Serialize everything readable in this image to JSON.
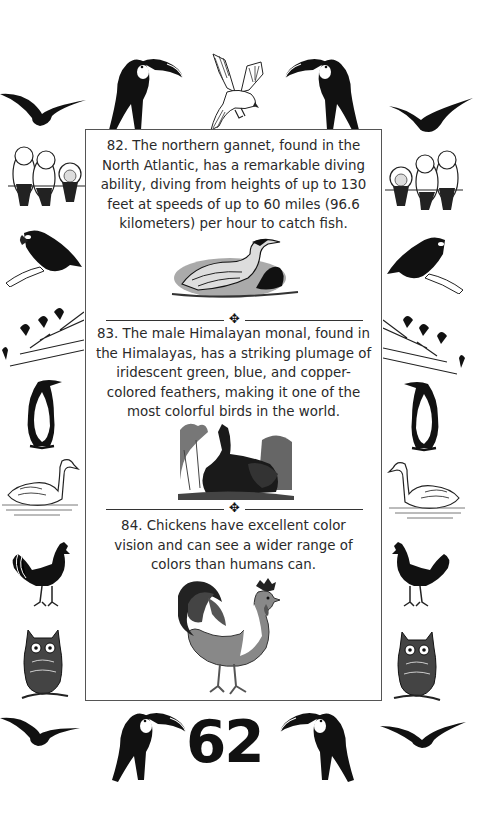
{
  "page": {
    "page_number": "62",
    "facts": [
      {
        "number": "82",
        "text": "82. The northern gannet, found in the North Atlantic, has a remarkable diving ability, diving from heights of up to 130 feet at speeds of up to 60 miles (96.6 kilometers) per hour to catch fish.",
        "lines": [
          "82. The northern gannet, found in the",
          "North Atlantic, has a remarkable diving",
          "ability, diving from heights of up to 130",
          "feet at speeds of up to 60 miles (96.6",
          "kilometers) per hour to catch fish."
        ],
        "illustration": "northern-gannet-engraving"
      },
      {
        "number": "83",
        "text": "83. The male Himalayan monal, found in the Himalayas, has a striking plumage of iridescent green, blue, and copper-colored feathers, making it one of the most colorful birds in the world.",
        "lines": [
          "83. The male Himalayan monal, found in",
          "the Himalayas, has a striking plumage of",
          "iridescent green, blue, and copper-",
          "colored feathers, making it one of the",
          "most colorful birds in the world."
        ],
        "illustration": "himalayan-monal-engraving"
      },
      {
        "number": "84",
        "text": "84. Chickens have excellent color vision and can see a wider range of colors than humans can.",
        "lines": [
          "84. Chickens have excellent color",
          "vision and can see a wider range of",
          "colors than humans can."
        ],
        "illustration": "rooster-illustration"
      }
    ],
    "divider_ornament": "✥",
    "border_birds": {
      "top": [
        "toucan",
        "white-bird-flying",
        "toucan"
      ],
      "left": [
        "flying-bird-silhouette",
        "owls-on-wire",
        "parrot-on-branch",
        "birds-on-branches",
        "penguin",
        "swan",
        "rooster",
        "owl",
        "flying-bird-silhouette"
      ],
      "right": [
        "flying-bird-silhouette",
        "owls-on-wire",
        "parrot-on-branch",
        "birds-on-branches",
        "penguin",
        "swan",
        "rooster",
        "owl",
        "flying-bird-silhouette"
      ],
      "bottom": [
        "toucan",
        "toucan"
      ]
    },
    "colors": {
      "ink": "#111111",
      "text": "#2a2a2a",
      "border": "#555555",
      "background": "#ffffff"
    }
  }
}
